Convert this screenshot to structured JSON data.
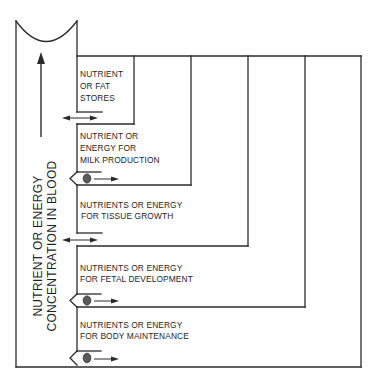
{
  "diagram": {
    "axis_label": {
      "line1": "NUTRIENT OR ENERGY",
      "line2": "CONCENTRATION IN BLOOD"
    },
    "compartments": [
      {
        "id": "fat-stores",
        "lines": [
          "NUTRIENT",
          "OR FAT",
          "STORES"
        ],
        "exchange": "bidirectional"
      },
      {
        "id": "milk-production",
        "lines": [
          "NUTRIENT OR",
          "ENERGY FOR",
          "MILK PRODUCTION"
        ],
        "exchange": "valve"
      },
      {
        "id": "tissue-growth",
        "lines": [
          "NUTRIENTS OR ENERGY",
          "FOR TISSUE GROWTH"
        ],
        "exchange": "bidirectional"
      },
      {
        "id": "fetal-development",
        "lines": [
          "NUTRIENTS OR ENERGY",
          "FOR FETAL DEVELOPMENT"
        ],
        "exchange": "valve"
      },
      {
        "id": "body-maintenance",
        "lines": [
          "NUTRIENTS OR ENERGY",
          "FOR BODY MAINTENANCE"
        ],
        "exchange": "valve"
      }
    ],
    "colors": {
      "line": "#2b2b2b",
      "valve_ball": "#5a5a5a",
      "background": "#ffffff"
    }
  }
}
